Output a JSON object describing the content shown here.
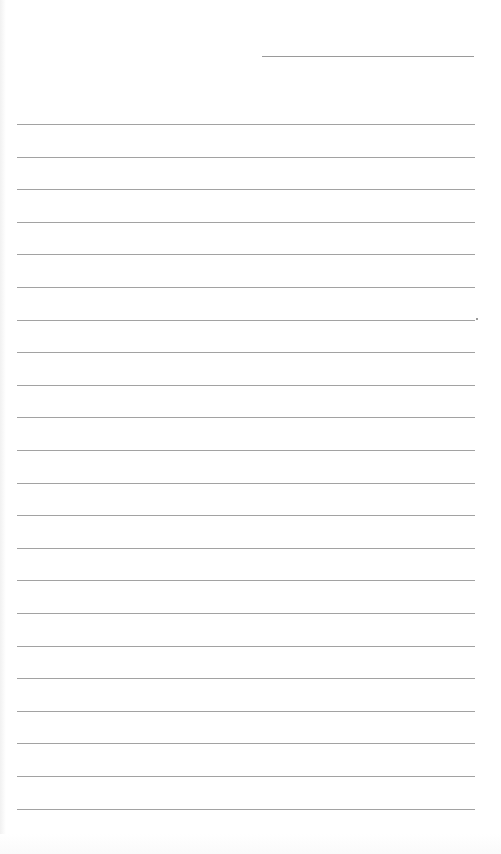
{
  "page": {
    "type": "lined-paper",
    "background": "#ffffff",
    "line_color": "#a2a2a2",
    "header_line": {
      "x": 262,
      "y": 56,
      "width": 212
    },
    "rules": {
      "count": 22,
      "first_y": 124,
      "spacing": 32.6,
      "x": 17,
      "width": 458
    }
  }
}
